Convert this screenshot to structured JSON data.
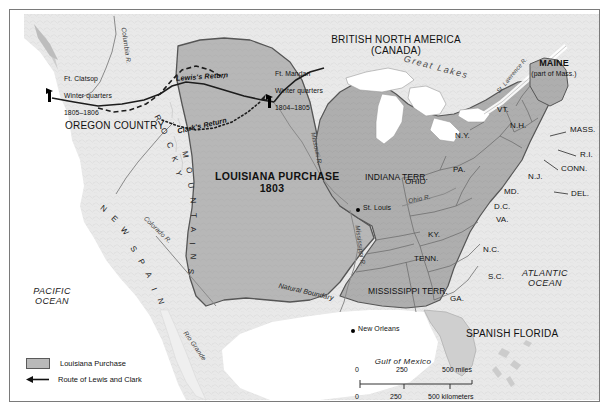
{
  "map": {
    "title_region": "LOUISIANA PURCHASE 1803",
    "territories": [
      {
        "name": "BRITISH NORTH AMERICA",
        "sub": "(CANADA)"
      },
      {
        "name": "OREGON COUNTRY"
      },
      {
        "name": "LOUISIANA PURCHASE",
        "year": "1803"
      },
      {
        "name": "NEW SPAIN"
      },
      {
        "name": "SPANISH FLORIDA"
      },
      {
        "name": "INDIANA TERR."
      },
      {
        "name": "MISSISSIPPI TERR."
      },
      {
        "name": "MAINE",
        "sub": "(part of Mass.)"
      }
    ],
    "states": [
      {
        "label": "OHIO"
      },
      {
        "label": "PA."
      },
      {
        "label": "N.Y."
      },
      {
        "label": "VT."
      },
      {
        "label": "N.H."
      },
      {
        "label": "MASS."
      },
      {
        "label": "R.I."
      },
      {
        "label": "CONN."
      },
      {
        "label": "N.J."
      },
      {
        "label": "DEL."
      },
      {
        "label": "MD."
      },
      {
        "label": "D.C."
      },
      {
        "label": "VA."
      },
      {
        "label": "KY."
      },
      {
        "label": "TENN."
      },
      {
        "label": "N.C."
      },
      {
        "label": "S.C."
      },
      {
        "label": "GA."
      }
    ],
    "oceans": [
      {
        "line1": "PACIFIC",
        "line2": "OCEAN"
      },
      {
        "line1": "ATLANTIC",
        "line2": "OCEAN"
      },
      {
        "line1": "Gulf of Mexico"
      }
    ],
    "rivers": [
      {
        "label": "Columbia R."
      },
      {
        "label": "Colorado R."
      },
      {
        "label": "Missouri R."
      },
      {
        "label": "Mississippi R."
      },
      {
        "label": "Ohio R."
      },
      {
        "label": "Rio Grande"
      },
      {
        "label": "St. Lawrence R."
      },
      {
        "label": "Great Lakes"
      }
    ],
    "forts": [
      {
        "name": "Ft. Clatsop",
        "line2": "Winter quarters",
        "line3": "1805–1806"
      },
      {
        "name": "Ft. Mandan",
        "line2": "Winter quarters",
        "line3": "1804–1805"
      }
    ],
    "routes": [
      {
        "label": "Lewis's Return"
      },
      {
        "label": "Clark's Return"
      }
    ],
    "cities": [
      {
        "name": "St. Louis"
      },
      {
        "name": "New Orleans"
      }
    ],
    "mountains": {
      "label": "ROCKY MOUNTAINS",
      "letters_rocky": "R O C K Y",
      "letters_mtns": "M O U N T A I N S"
    },
    "boundary_note": "Natural Boundary"
  },
  "legend": {
    "items": [
      {
        "symbol": "swatch",
        "label": "Louisiana Purchase"
      },
      {
        "symbol": "arrow",
        "label": "Route of Lewis and Clark"
      }
    ]
  },
  "scale": {
    "miles": {
      "ticks": [
        "0",
        "250",
        "500 miles"
      ]
    },
    "kilometers": {
      "ticks": [
        "0",
        "250",
        "500 kilometers"
      ]
    }
  },
  "colors": {
    "purchase_fill": "#b9b9b9",
    "us_fill": "#b0b0b0",
    "land_fill": "#e6e6e6",
    "water": "#ffffff",
    "border": "#555555",
    "frame": "#7a7a7a"
  }
}
